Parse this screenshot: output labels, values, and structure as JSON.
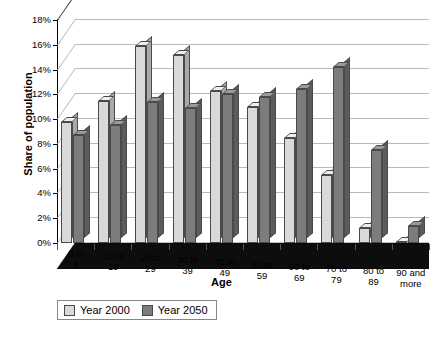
{
  "chart_data": {
    "type": "bar",
    "title": "",
    "xlabel": "Age",
    "ylabel": "Share of population",
    "categories": [
      "0 to\n9",
      "10 to\n19",
      "20 to\n29",
      "30 to\n39",
      "40 to\n49",
      "50 to\n59",
      "60 to\n69",
      "70 to\n79",
      "80 to\n89",
      "90 and\nmore"
    ],
    "series": [
      {
        "name": "Year 2000",
        "color": "#d9d9d9",
        "values": [
          9.8,
          11.5,
          15.9,
          15.2,
          12.3,
          11.0,
          8.5,
          5.5,
          1.2,
          0.1
        ]
      },
      {
        "name": "Year 2050",
        "color": "#7c7c7c",
        "values": [
          8.7,
          9.5,
          11.4,
          10.9,
          12.0,
          11.8,
          12.4,
          14.2,
          7.5,
          1.4
        ]
      }
    ],
    "ylim": [
      0,
      18
    ],
    "ytick_values": [
      0,
      2,
      4,
      6,
      8,
      10,
      12,
      14,
      16,
      18
    ],
    "ytick_labels": [
      "0%",
      "2%",
      "4%",
      "6%",
      "8%",
      "10%",
      "12%",
      "14%",
      "16%",
      "18%"
    ],
    "grid": true,
    "legend_position": "bottom-left",
    "three_d": true
  },
  "legend": {
    "items": [
      {
        "label": "Year 2000"
      },
      {
        "label": "Year 2050"
      }
    ]
  },
  "axis": {
    "x_title": "Age",
    "y_title": "Share of population"
  }
}
